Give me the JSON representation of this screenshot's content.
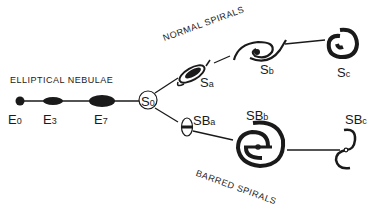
{
  "diagram": {
    "categories": {
      "elliptical": "ELLIPTICAL NEBULAE",
      "normal": "NORMAL SPIRALS",
      "barred": "BARRED SPIRALS"
    },
    "nodes": {
      "e0": {
        "main": "E",
        "sub": "0"
      },
      "e3": {
        "main": "E",
        "sub": "3"
      },
      "e7": {
        "main": "E",
        "sub": "7"
      },
      "s0": {
        "main": "S",
        "sub": "0"
      },
      "sa": {
        "main": "S",
        "sub": "a"
      },
      "sb": {
        "main": "S",
        "sub": "b"
      },
      "sc": {
        "main": "S",
        "sub": "c"
      },
      "sba": {
        "main": "SB",
        "sub": "a"
      },
      "sbb": {
        "main": "SB",
        "sub": "b"
      },
      "sbc": {
        "main": "SB",
        "sub": "c"
      }
    },
    "colors": {
      "ink": "#1a1a1a",
      "background": "#ffffff"
    }
  }
}
